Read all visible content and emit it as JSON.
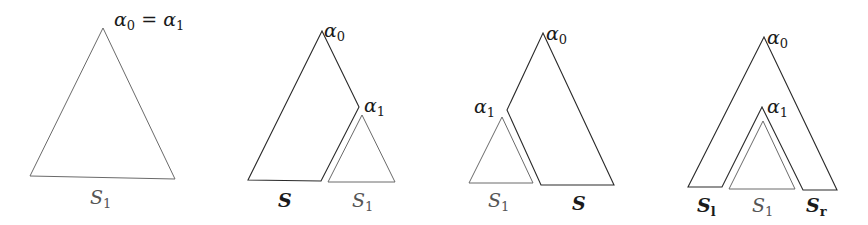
{
  "figures": [
    {
      "id": "case-1",
      "apex_label": "α",
      "apex_sub_0": "0",
      "equals": " = ",
      "apex_label_2": "α",
      "apex_sub_1": "1",
      "subtree_label": "S",
      "subtree_sub": "1"
    },
    {
      "id": "case-2",
      "root_label": "α",
      "root_sub": "0",
      "child_label": "α",
      "child_sub": "1",
      "remainder_label": "S",
      "subtree_label": "S",
      "subtree_sub": "1"
    },
    {
      "id": "case-3",
      "root_label": "α",
      "root_sub": "0",
      "child_label": "α",
      "child_sub": "1",
      "subtree_label": "S",
      "subtree_sub": "1",
      "remainder_label": "S"
    },
    {
      "id": "case-4",
      "root_label": "α",
      "root_sub": "0",
      "child_label": "α",
      "child_sub": "1",
      "left_label": "S",
      "left_sub": "l",
      "subtree_label": "S",
      "subtree_sub": "1",
      "right_label": "S",
      "right_sub": "r"
    }
  ]
}
